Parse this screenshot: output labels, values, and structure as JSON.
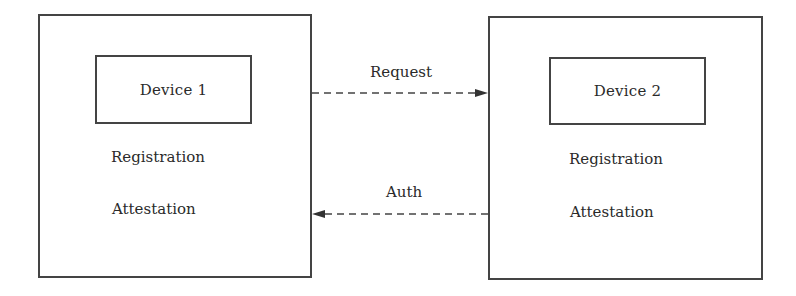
{
  "diagram": {
    "left_node": {
      "title": "Device 1",
      "items": [
        "Registration",
        "Attestation"
      ]
    },
    "right_node": {
      "title": "Device 2",
      "items": [
        "Registration",
        "Attestation"
      ]
    },
    "edges": [
      {
        "label": "Request",
        "from": "Device 1",
        "to": "Device 2",
        "style": "dashed"
      },
      {
        "label": "Auth",
        "from": "Device 2",
        "to": "Device 1",
        "style": "dashed"
      }
    ],
    "colors": {
      "stroke": "#444444",
      "text": "#2a2a2a",
      "background": "#ffffff"
    }
  }
}
